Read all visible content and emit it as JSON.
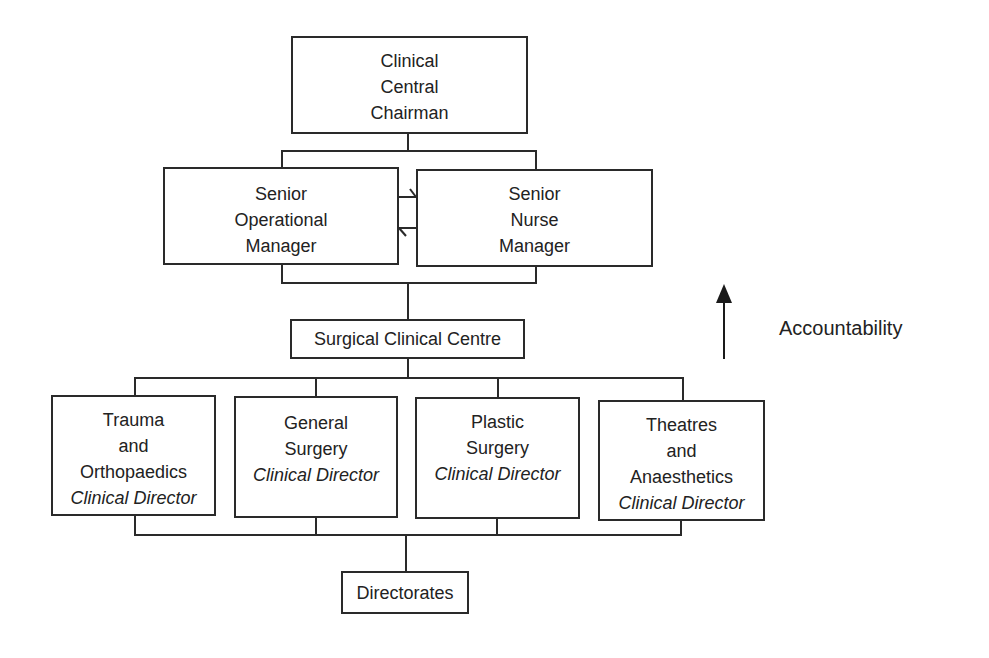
{
  "diagram": {
    "type": "org-chart",
    "top": {
      "lines": [
        "Clinical",
        "Central",
        "Chairman"
      ]
    },
    "managers": [
      {
        "lines": [
          "Senior",
          "Operational",
          "Manager"
        ]
      },
      {
        "lines": [
          "Senior",
          "Nurse",
          "Manager"
        ]
      }
    ],
    "centre": {
      "label": "Surgical Clinical Centre"
    },
    "directors": [
      {
        "lines": [
          "Trauma",
          "and",
          "Orthopaedics"
        ],
        "role": "Clinical Director"
      },
      {
        "lines": [
          "General",
          "Surgery"
        ],
        "role": "Clinical Director"
      },
      {
        "lines": [
          "Plastic",
          "Surgery"
        ],
        "role": "Clinical Director"
      },
      {
        "lines": [
          "Theatres",
          "and",
          "Anaesthetics"
        ],
        "role": "Clinical Director"
      }
    ],
    "bottom": {
      "label": "Directorates"
    },
    "legend": {
      "arrow_direction": "up",
      "label": "Accountability"
    },
    "colors": {
      "line": "#2a2a2a",
      "text": "#222222",
      "background": "#ffffff"
    }
  }
}
